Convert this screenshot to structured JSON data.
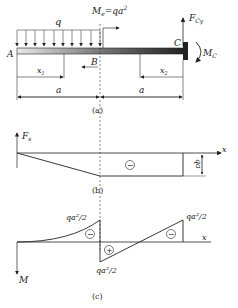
{
  "figure_a": {
    "caption": "(a)",
    "load_label": "q",
    "moment_label": "M",
    "moment_sub": "e",
    "moment_eq": "=qa",
    "moment_sup": "2",
    "reaction_force": "F",
    "reaction_force_sub": "Cy",
    "reaction_moment": "M",
    "reaction_moment_sub": "C",
    "point_a": "A",
    "point_b": "B",
    "point_c": "C",
    "dim_x1": "x",
    "dim_x1_sub": "1",
    "dim_x2": "x",
    "dim_x2_sub": "2",
    "dim_left": "a",
    "dim_right": "a"
  },
  "figure_b": {
    "caption": "(b)",
    "axis_y_label": "F",
    "axis_y_sub": "s",
    "axis_x_label": "x",
    "sign": "−",
    "magnitude": "qa"
  },
  "figure_c": {
    "caption": "(c)",
    "axis_y_label": "M",
    "axis_x_label": "x",
    "label_b_left": "qa²/2",
    "label_b_right": "qa²/2",
    "label_c": "qa²/2",
    "sign_left": "−",
    "sign_mid": "+",
    "sign_right": "−"
  }
}
